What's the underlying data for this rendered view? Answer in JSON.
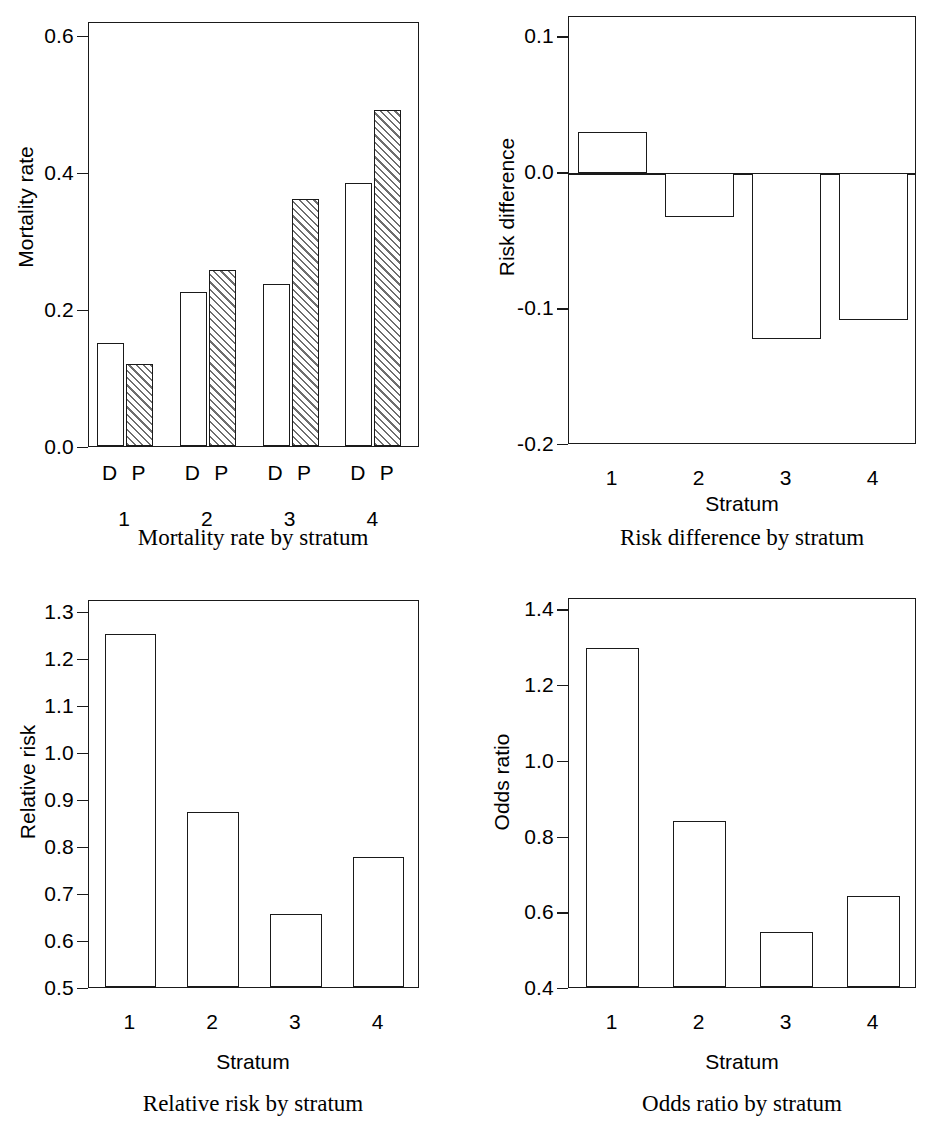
{
  "chart_data": [
    {
      "type": "bar",
      "id": "mortality-rate",
      "title": "Mortality rate by stratum",
      "xlabel": "",
      "ylabel": "Mortality rate",
      "categories": [
        "1",
        "2",
        "3",
        "4"
      ],
      "group_labels": [
        "D",
        "P"
      ],
      "series": [
        {
          "name": "D",
          "values": [
            0.15,
            0.225,
            0.237,
            0.383
          ],
          "fill": "open"
        },
        {
          "name": "P",
          "values": [
            0.12,
            0.257,
            0.36,
            0.49
          ],
          "fill": "hatched"
        }
      ],
      "yticks": [
        "0.0",
        "0.2",
        "0.4",
        "0.6"
      ],
      "ytickvalues": [
        0.0,
        0.2,
        0.4,
        0.6
      ],
      "ylim": [
        0.0,
        0.62
      ],
      "grid": false,
      "legend": "none"
    },
    {
      "type": "bar",
      "id": "risk-difference",
      "title": "Risk difference by stratum",
      "xlabel": "Stratum",
      "ylabel": "Risk difference",
      "categories": [
        "1",
        "2",
        "3",
        "4"
      ],
      "values": [
        0.03,
        -0.032,
        -0.122,
        -0.108
      ],
      "yticks": [
        "0.1",
        "0.0",
        "-0.1",
        "-0.2"
      ],
      "ytickvalues": [
        0.1,
        0.0,
        -0.1,
        -0.2
      ],
      "ylim": [
        -0.2,
        0.115
      ],
      "zero_line": 0.0,
      "grid": false,
      "legend": "none"
    },
    {
      "type": "bar",
      "id": "relative-risk",
      "title": "Relative risk by stratum",
      "xlabel": "Stratum",
      "ylabel": "Relative risk",
      "categories": [
        "1",
        "2",
        "3",
        "4"
      ],
      "values": [
        1.255,
        0.877,
        0.66,
        0.78
      ],
      "yticks": [
        "1.3",
        "1.2",
        "1.1",
        "1.0",
        "0.9",
        "0.8",
        "0.7",
        "0.6",
        "0.5"
      ],
      "ytickvalues": [
        1.3,
        1.2,
        1.1,
        1.0,
        0.9,
        0.8,
        0.7,
        0.6,
        0.5
      ],
      "ylim": [
        0.5,
        1.325
      ],
      "grid": false,
      "legend": "none"
    },
    {
      "type": "bar",
      "id": "odds-ratio",
      "title": "Odds ratio by stratum",
      "xlabel": "Stratum",
      "ylabel": "Odds ratio",
      "categories": [
        "1",
        "2",
        "3",
        "4"
      ],
      "values": [
        1.3,
        0.845,
        0.55,
        0.645
      ],
      "yticks": [
        "1.4",
        "1.2",
        "1.0",
        "0.8",
        "0.6",
        "0.4"
      ],
      "ytickvalues": [
        1.4,
        1.2,
        1.0,
        0.8,
        0.6,
        0.4
      ],
      "ylim": [
        0.4,
        1.43
      ],
      "grid": false,
      "legend": "none"
    }
  ],
  "panels": {
    "mortality": {
      "ylabel": "Mortality rate",
      "caption": "Mortality rate by stratum",
      "yticks": [
        "0.6",
        "0.4",
        "0.2",
        "0.0"
      ],
      "group_marks": [
        "D",
        "P",
        "D",
        "P",
        "D",
        "P",
        "D",
        "P"
      ],
      "strata": [
        "1",
        "2",
        "3",
        "4"
      ]
    },
    "risk_difference": {
      "ylabel": "Risk difference",
      "caption": "Risk difference by stratum",
      "xaxistitle": "Stratum",
      "yticks": [
        "0.1",
        "0.0",
        "-0.1",
        "-0.2"
      ],
      "strata": [
        "1",
        "2",
        "3",
        "4"
      ]
    },
    "relative_risk": {
      "ylabel": "Relative risk",
      "caption": "Relative risk by stratum",
      "xaxistitle": "Stratum",
      "yticks": [
        "1.3",
        "1.2",
        "1.1",
        "1.0",
        "0.9",
        "0.8",
        "0.7",
        "0.6",
        "0.5"
      ],
      "strata": [
        "1",
        "2",
        "3",
        "4"
      ]
    },
    "odds_ratio": {
      "ylabel": "Odds ratio",
      "caption": "Odds ratio by stratum",
      "xaxistitle": "Stratum",
      "yticks": [
        "1.4",
        "1.2",
        "1.0",
        "0.8",
        "0.6",
        "0.4"
      ],
      "strata": [
        "1",
        "2",
        "3",
        "4"
      ]
    }
  },
  "style": {
    "axis_color": "#1a1a1a",
    "bar_fill": "#ffffff",
    "hatch_color": "#6e6e6e",
    "background": "#ffffff"
  }
}
